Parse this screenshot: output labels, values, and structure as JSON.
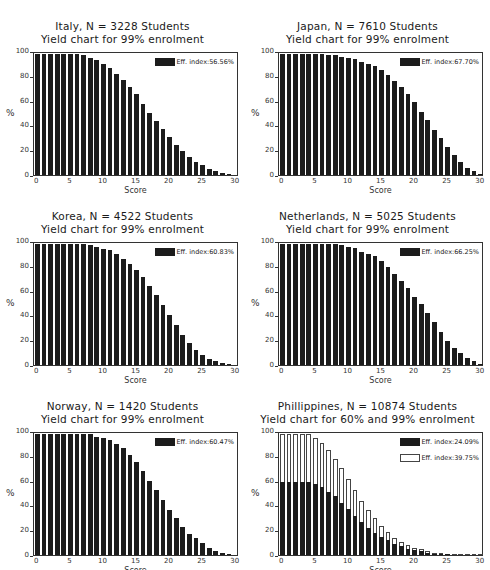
{
  "chart_data": [
    {
      "type": "bar",
      "title": "Italy, N = 3228 Students",
      "subtitle": "Yield chart for 99% enrolment",
      "xlabel": "Score",
      "ylabel": "%",
      "ylim": [
        0,
        100
      ],
      "xlim": [
        0,
        30
      ],
      "xticks": [
        "0",
        "5",
        "10",
        "15",
        "20",
        "25",
        "30"
      ],
      "yticks": [
        "0",
        "20",
        "40",
        "60",
        "80",
        "100"
      ],
      "grid": false,
      "legend_position": "top-right",
      "x": [
        0,
        1,
        2,
        3,
        4,
        5,
        6,
        7,
        8,
        9,
        10,
        11,
        12,
        13,
        14,
        15,
        16,
        17,
        18,
        19,
        20,
        21,
        22,
        23,
        24,
        25,
        26,
        27,
        28,
        29,
        30
      ],
      "series": [
        {
          "name": "Eff. index:56.56%",
          "fill": "solid",
          "values": [
            99,
            99,
            99,
            99,
            99,
            99,
            99,
            98,
            96,
            94,
            91,
            88,
            83,
            78,
            72,
            66,
            58,
            51,
            44,
            38,
            31,
            25,
            20,
            15,
            11,
            8,
            5,
            3,
            2,
            1,
            0
          ]
        }
      ]
    },
    {
      "type": "bar",
      "title": "Japan, N = 7610 Students",
      "subtitle": "Yield chart for 99% enrolment",
      "xlabel": "Score",
      "ylabel": "%",
      "ylim": [
        0,
        100
      ],
      "xlim": [
        0,
        30
      ],
      "xticks": [
        "0",
        "5",
        "10",
        "15",
        "20",
        "25",
        "30"
      ],
      "yticks": [
        "0",
        "20",
        "40",
        "60",
        "80",
        "100"
      ],
      "grid": false,
      "legend_position": "top-right",
      "x": [
        0,
        1,
        2,
        3,
        4,
        5,
        6,
        7,
        8,
        9,
        10,
        11,
        12,
        13,
        14,
        15,
        16,
        17,
        18,
        19,
        20,
        21,
        22,
        23,
        24,
        25,
        26,
        27,
        28,
        29,
        30
      ],
      "series": [
        {
          "name": "Eff. index:67.70%",
          "fill": "solid",
          "values": [
            99,
            99,
            99,
            99,
            99,
            99,
            99,
            98,
            98,
            97,
            96,
            95,
            93,
            91,
            89,
            86,
            82,
            77,
            72,
            66,
            60,
            52,
            45,
            37,
            30,
            23,
            16,
            11,
            6,
            3,
            1
          ]
        }
      ]
    },
    {
      "type": "bar",
      "title": "Korea, N = 4522 Students",
      "subtitle": "Yield chart for 99% enrolment",
      "xlabel": "Score",
      "ylabel": "%",
      "ylim": [
        0,
        100
      ],
      "xlim": [
        0,
        30
      ],
      "xticks": [
        "0",
        "5",
        "10",
        "15",
        "20",
        "25",
        "30"
      ],
      "yticks": [
        "0",
        "20",
        "40",
        "60",
        "80",
        "100"
      ],
      "grid": false,
      "legend_position": "top-right",
      "x": [
        0,
        1,
        2,
        3,
        4,
        5,
        6,
        7,
        8,
        9,
        10,
        11,
        12,
        13,
        14,
        15,
        16,
        17,
        18,
        19,
        20,
        21,
        22,
        23,
        24,
        25,
        26,
        27,
        28,
        29,
        30
      ],
      "series": [
        {
          "name": "Eff. index:60.83%",
          "fill": "solid",
          "values": [
            99,
            99,
            99,
            99,
            99,
            99,
            99,
            99,
            98,
            97,
            95,
            94,
            91,
            87,
            83,
            78,
            72,
            65,
            57,
            49,
            41,
            33,
            25,
            18,
            12,
            8,
            5,
            3,
            2,
            1,
            0
          ]
        }
      ]
    },
    {
      "type": "bar",
      "title": "Netherlands, N = 5025 Students",
      "subtitle": "Yield chart for 99% enrolment",
      "xlabel": "Score",
      "ylabel": "%",
      "ylim": [
        0,
        100
      ],
      "xlim": [
        0,
        30
      ],
      "xticks": [
        "0",
        "5",
        "10",
        "15",
        "20",
        "25",
        "30"
      ],
      "yticks": [
        "0",
        "20",
        "40",
        "60",
        "80",
        "100"
      ],
      "grid": false,
      "legend_position": "top-right",
      "x": [
        0,
        1,
        2,
        3,
        4,
        5,
        6,
        7,
        8,
        9,
        10,
        11,
        12,
        13,
        14,
        15,
        16,
        17,
        18,
        19,
        20,
        21,
        22,
        23,
        24,
        25,
        26,
        27,
        28,
        29,
        30
      ],
      "series": [
        {
          "name": "Eff. index:66.25%",
          "fill": "solid",
          "values": [
            99,
            99,
            99,
            99,
            99,
            99,
            99,
            99,
            99,
            98,
            97,
            96,
            93,
            91,
            89,
            85,
            80,
            75,
            69,
            63,
            56,
            50,
            43,
            35,
            27,
            20,
            14,
            10,
            6,
            3,
            1
          ]
        }
      ]
    },
    {
      "type": "bar",
      "title": "Norway, N = 1420 Students",
      "subtitle": "Yield chart for 99% enrolment",
      "xlabel": "Score",
      "ylabel": "%",
      "ylim": [
        0,
        100
      ],
      "xlim": [
        0,
        30
      ],
      "xticks": [
        "0",
        "5",
        "10",
        "15",
        "20",
        "25",
        "30"
      ],
      "yticks": [
        "0",
        "20",
        "40",
        "60",
        "80",
        "100"
      ],
      "grid": false,
      "legend_position": "top-right",
      "x": [
        0,
        1,
        2,
        3,
        4,
        5,
        6,
        7,
        8,
        9,
        10,
        11,
        12,
        13,
        14,
        15,
        16,
        17,
        18,
        19,
        20,
        21,
        22,
        23,
        24,
        25,
        26,
        27,
        28,
        29,
        30
      ],
      "series": [
        {
          "name": "Eff. index:60.47%",
          "fill": "solid",
          "values": [
            99,
            99,
            99,
            99,
            99,
            99,
            99,
            99,
            99,
            97,
            96,
            94,
            91,
            88,
            82,
            76,
            69,
            61,
            53,
            45,
            37,
            30,
            23,
            17,
            14,
            10,
            6,
            3,
            2,
            1,
            0
          ]
        }
      ]
    },
    {
      "type": "bar",
      "title": "Phillippines, N = 10874 Students",
      "subtitle": "Yield chart for 60% and 99% enrolment",
      "xlabel": "Score",
      "ylabel": "%",
      "ylim": [
        0,
        100
      ],
      "xlim": [
        0,
        30
      ],
      "xticks": [
        "0",
        "5",
        "10",
        "15",
        "20",
        "25",
        "30"
      ],
      "yticks": [
        "0",
        "20",
        "40",
        "60",
        "80",
        "100"
      ],
      "grid": false,
      "legend_position": "top-right",
      "overlay": true,
      "x": [
        0,
        1,
        2,
        3,
        4,
        5,
        6,
        7,
        8,
        9,
        10,
        11,
        12,
        13,
        14,
        15,
        16,
        17,
        18,
        19,
        20,
        21,
        22,
        23,
        24,
        25,
        26,
        27,
        28,
        29,
        30
      ],
      "series": [
        {
          "name": "Eff. index:24.09%",
          "fill": "solid",
          "values": [
            60,
            60,
            60,
            60,
            60,
            58,
            56,
            52,
            48,
            43,
            38,
            32,
            27,
            22,
            18,
            15,
            12,
            9,
            7,
            5,
            4,
            3,
            2,
            1,
            1,
            1,
            0,
            0,
            0,
            0,
            0
          ]
        },
        {
          "name": "Eff. index:39.75%",
          "fill": "hollow",
          "values": [
            99,
            99,
            99,
            99,
            99,
            96,
            92,
            86,
            79,
            71,
            62,
            53,
            44,
            37,
            30,
            24,
            19,
            14,
            11,
            8,
            6,
            5,
            3,
            2,
            2,
            1,
            1,
            0,
            0,
            0,
            0
          ]
        }
      ]
    }
  ]
}
